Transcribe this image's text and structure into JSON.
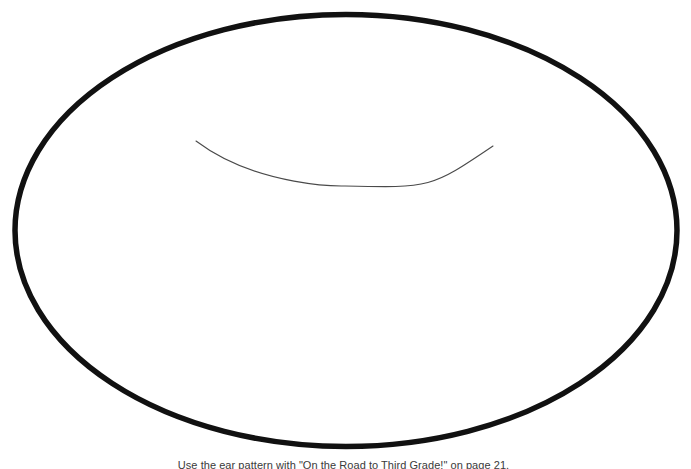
{
  "page": {
    "width": 691,
    "height": 469,
    "background_color": "#ffffff"
  },
  "header": {
    "text": "Ear Pattern",
    "color": "#e9e9e9"
  },
  "pattern": {
    "name": "ear-pattern",
    "outline": {
      "shape": "ellipse",
      "center_x": 346,
      "center_y": 230.5,
      "radius_x": 331,
      "radius_y": 216,
      "stroke_color": "#111111",
      "stroke_width": 5.5,
      "fill": "none"
    },
    "inner_arc": {
      "shape": "arc",
      "start_x": 196,
      "start_y": 141,
      "end_x": 493,
      "end_y": 146,
      "low_point_x": 345,
      "low_point_y": 186,
      "stroke_color": "#4a4a4a",
      "stroke_width": 1.1,
      "fill": "none"
    }
  },
  "caption": {
    "text": "Use the ear pattern with \"On the Road to Third Grade!\" on page 21.",
    "color": "#3a3a3a",
    "reference_title": "On the Road to Third Grade!",
    "reference_page": "21"
  }
}
